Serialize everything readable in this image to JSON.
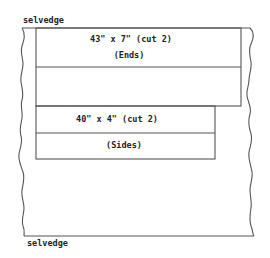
{
  "diagram": {
    "top_edge_label": "selvedge",
    "bottom_edge_label": "selvedge",
    "pieces": [
      {
        "name": "ends",
        "dimension_label": "43\" x 7\" (cut 2)",
        "part_label": "(Ends)"
      },
      {
        "name": "sides",
        "dimension_label": "40\" x 4\" (cut 2)",
        "part_label": "(Sides)"
      }
    ],
    "colors": {
      "line": "#555555",
      "text": "#222222",
      "background": "#ffffff"
    }
  }
}
